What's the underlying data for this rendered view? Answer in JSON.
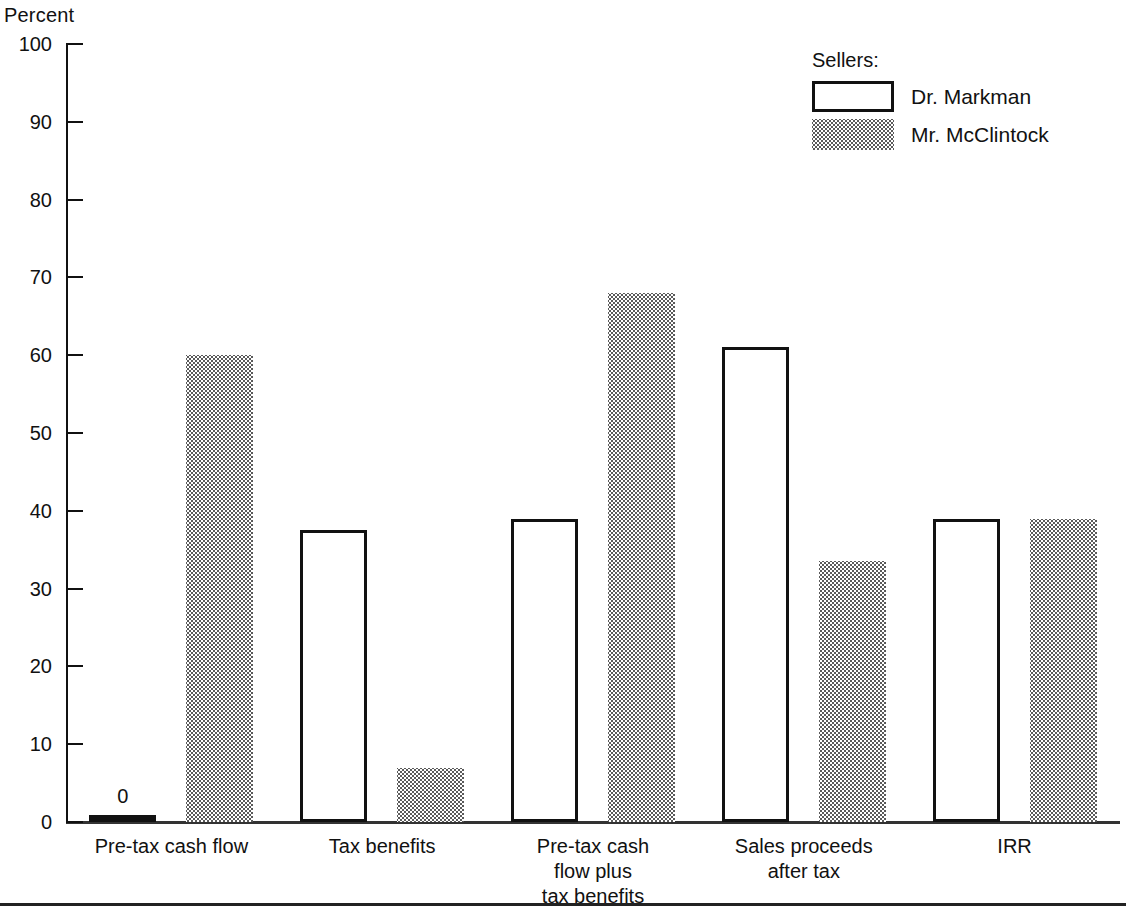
{
  "chart_data": {
    "type": "bar",
    "title": "",
    "ylabel": "Percent",
    "xlabel": "",
    "ylim": [
      0,
      100
    ],
    "yticks": [
      0,
      10,
      20,
      30,
      40,
      50,
      60,
      70,
      80,
      90,
      100
    ],
    "grid": false,
    "legend_position": "top-right",
    "legend_title": "Sellers:",
    "categories": [
      "Pre-tax cash flow",
      "Tax benefits",
      "Pre-tax cash\nflow plus\ntax benefits",
      "Sales proceeds\nafter tax",
      "IRR"
    ],
    "series": [
      {
        "name": "Dr. Markman",
        "style": "outline",
        "values": [
          0,
          37.5,
          39,
          61,
          39
        ]
      },
      {
        "name": "Mr. McClintock",
        "style": "stipple",
        "values": [
          60,
          7,
          68,
          33.5,
          39
        ]
      }
    ],
    "annotations": [
      {
        "text": "0",
        "series": "Dr. Markman",
        "category": "Pre-tax cash flow",
        "value": 0
      }
    ]
  },
  "axis": {
    "y_title": "Percent",
    "tick_labels": [
      "100",
      "90",
      "80",
      "70",
      "60",
      "50",
      "40",
      "30",
      "20",
      "10",
      "0"
    ]
  },
  "legend": {
    "title": "Sellers:",
    "entries": [
      {
        "label": "Dr. Markman",
        "swatch": "outline-swatch"
      },
      {
        "label": "Mr. McClintock",
        "swatch": "stipple-swatch"
      }
    ]
  },
  "colors": {
    "line": "#111111",
    "stipple_dot": "#5a5a5a",
    "background": "#ffffff"
  }
}
